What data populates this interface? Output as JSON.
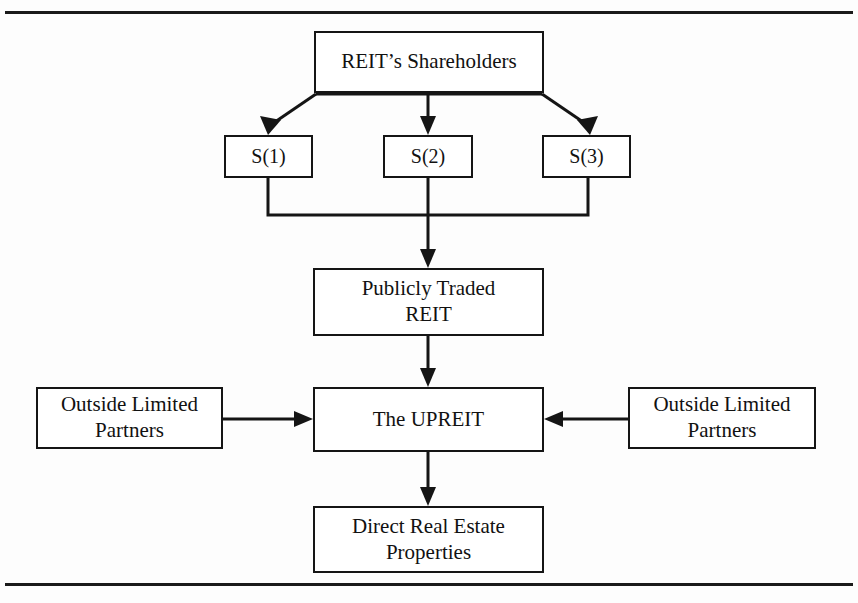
{
  "diagram": {
    "type": "flowchart",
    "cut_off_text": "",
    "nodes": [
      {
        "id": "shareholders",
        "label": "REIT’s Shareholders",
        "level": 1
      },
      {
        "id": "s1",
        "label": "S(1)",
        "level": 2
      },
      {
        "id": "s2",
        "label": "S(2)",
        "level": 2
      },
      {
        "id": "s3",
        "label": "S(3)",
        "level": 2
      },
      {
        "id": "reit",
        "label": "Publicly Traded\nREIT",
        "line1": "Publicly Traded",
        "line2": "REIT",
        "level": 3
      },
      {
        "id": "olp-left",
        "label": "Outside Limited\nPartners",
        "line1": "Outside Limited",
        "line2": "Partners",
        "level": 4
      },
      {
        "id": "upreit",
        "label": "The UPREIT",
        "level": 4
      },
      {
        "id": "olp-right",
        "label": "Outside Limited\nPartners",
        "line1": "Outside Limited",
        "line2": "Partners",
        "level": 4
      },
      {
        "id": "properties",
        "label": "Direct Real Estate\nProperties",
        "line1": "Direct Real Estate",
        "line2": "Properties",
        "level": 5
      }
    ],
    "edges": [
      {
        "from": "shareholders",
        "to": "s1",
        "style": "diagonal-arrow"
      },
      {
        "from": "shareholders",
        "to": "s2",
        "style": "vertical-arrow"
      },
      {
        "from": "shareholders",
        "to": "s3",
        "style": "diagonal-arrow"
      },
      {
        "from": "s1",
        "to": "reit",
        "style": "bus-merge-arrow"
      },
      {
        "from": "s2",
        "to": "reit",
        "style": "vertical-arrow"
      },
      {
        "from": "s3",
        "to": "reit",
        "style": "bus-merge-arrow"
      },
      {
        "from": "reit",
        "to": "upreit",
        "style": "vertical-arrow"
      },
      {
        "from": "olp-left",
        "to": "upreit",
        "style": "horizontal-arrow-right"
      },
      {
        "from": "olp-right",
        "to": "upreit",
        "style": "horizontal-arrow-left"
      },
      {
        "from": "upreit",
        "to": "properties",
        "style": "vertical-arrow"
      }
    ],
    "colors": {
      "stroke": "#151515",
      "box_fill": "#ffffff",
      "page_background": "#fdfdfd",
      "rule": "#1a1a1a"
    }
  }
}
